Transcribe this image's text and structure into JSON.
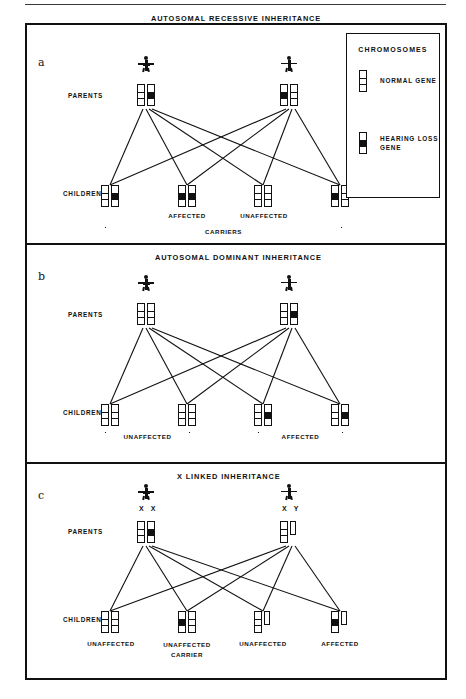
{
  "figure": {
    "panels": [
      {
        "letter": "a",
        "title": "AUTOSOMAL RECESSIVE INHERITANCE",
        "parents_label": "PARENTS",
        "children_label": "CHILDREN",
        "parents": [
          {
            "sex": "female",
            "genotype": [
              "normal",
              "affected"
            ]
          },
          {
            "sex": "male",
            "genotype": [
              "affected",
              "normal"
            ]
          }
        ],
        "children": [
          {
            "genotype": [
              "normal",
              "affected"
            ],
            "caption": ""
          },
          {
            "genotype": [
              "affected",
              "affected"
            ],
            "caption": "AFFECTED"
          },
          {
            "genotype": [
              "normal",
              "normal"
            ],
            "caption": "UNAFFECTED"
          },
          {
            "genotype": [
              "affected",
              "normal"
            ],
            "caption": ""
          }
        ],
        "brackets": [
          {
            "label": "CARRIERS",
            "from_child": 1,
            "to_child": 4
          }
        ]
      },
      {
        "letter": "b",
        "title": "AUTOSOMAL DOMINANT INHERITANCE",
        "parents_label": "PARENTS",
        "children_label": "CHILDREN",
        "parents": [
          {
            "sex": "female",
            "genotype": [
              "normal",
              "normal"
            ]
          },
          {
            "sex": "male",
            "genotype": [
              "normal",
              "affected"
            ]
          }
        ],
        "children": [
          {
            "genotype": [
              "normal",
              "normal"
            ],
            "caption": ""
          },
          {
            "genotype": [
              "normal",
              "normal"
            ],
            "caption": ""
          },
          {
            "genotype": [
              "normal",
              "affected"
            ],
            "caption": ""
          },
          {
            "genotype": [
              "normal",
              "affected"
            ],
            "caption": ""
          }
        ],
        "brackets": [
          {
            "label": "UNAFFECTED",
            "from_child": 1,
            "to_child": 2
          },
          {
            "label": "AFFECTED",
            "from_child": 3,
            "to_child": 4
          }
        ]
      },
      {
        "letter": "c",
        "title": "X LINKED INHERITANCE",
        "parents_label": "PARENTS",
        "children_label": "CHILDREN",
        "parents": [
          {
            "sex": "female",
            "sex_chromosomes": "X  X",
            "genotype": [
              "normal",
              "affected"
            ]
          },
          {
            "sex": "male",
            "sex_chromosomes": "X  Y",
            "genotype": [
              "normal",
              "y"
            ]
          }
        ],
        "children": [
          {
            "genotype": [
              "normal",
              "normal"
            ],
            "caption": "UNAFFECTED"
          },
          {
            "genotype": [
              "affected",
              "normal"
            ],
            "caption": "UNAFFECTED\nCARRIER"
          },
          {
            "genotype": [
              "normal",
              "y"
            ],
            "caption": "UNAFFECTED"
          },
          {
            "genotype": [
              "affected",
              "y"
            ],
            "caption": "AFFECTED"
          }
        ],
        "brackets": []
      }
    ],
    "legend": {
      "title": "CHROMOSOMES",
      "items": [
        {
          "label": "NORMAL GENE",
          "type": "normal"
        },
        {
          "label": "HEARING LOSS\nGENE",
          "type": "affected"
        }
      ]
    }
  }
}
